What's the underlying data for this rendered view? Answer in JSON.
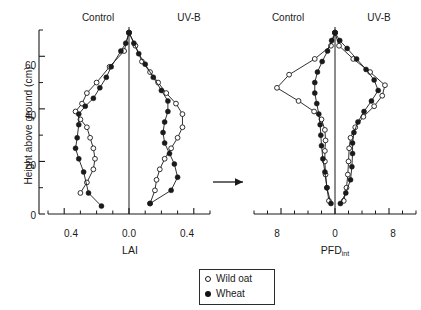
{
  "figure": {
    "ylabel": "Height above ground (cm)",
    "arrow": "arrow-right",
    "legend": {
      "items": [
        {
          "label": "Wild oat",
          "marker": "open-circle"
        },
        {
          "label": "Wheat",
          "marker": "filled-circle"
        }
      ]
    }
  },
  "chart_data": [
    {
      "type": "line",
      "id": "lai-panel",
      "title": "",
      "xlabel": "LAI",
      "ylabel": "Height above ground (cm)",
      "orientation": "horizontal-butterfly",
      "panels": [
        "Control",
        "UV-B"
      ],
      "xlim": [
        -0.5,
        0.5
      ],
      "ylim": [
        0,
        70
      ],
      "xticks_labeled": [
        {
          "value": -0.4,
          "label": "0.4"
        },
        {
          "value": 0.0,
          "label": "0.0"
        },
        {
          "value": 0.4,
          "label": "0.4"
        }
      ],
      "xticks_minor": [
        -0.5,
        -0.3,
        -0.2,
        -0.1,
        0.1,
        0.2,
        0.3,
        0.5
      ],
      "yticks_labeled": [
        {
          "value": 0,
          "label": "0"
        },
        {
          "value": 20,
          "label": "20"
        },
        {
          "value": 40,
          "label": "40"
        },
        {
          "value": 60,
          "label": "60"
        }
      ],
      "yticks_minor": [
        10,
        30,
        50,
        70
      ],
      "grid": false,
      "legend_position": "bottom-center",
      "series": [
        {
          "name": "Wild oat",
          "panel": "Control",
          "marker": "open-circle",
          "x": [
            0.0,
            -0.03,
            -0.12,
            -0.2,
            -0.26,
            -0.29,
            -0.33,
            -0.3,
            -0.26,
            -0.24,
            -0.22,
            -0.21,
            -0.22,
            -0.26,
            -0.3
          ],
          "y": [
            69,
            62,
            56,
            50,
            46,
            42,
            39,
            36,
            33,
            29,
            25,
            21,
            17,
            12,
            8
          ]
        },
        {
          "name": "Wheat",
          "panel": "Control",
          "marker": "filled-circle",
          "x": [
            0.0,
            -0.02,
            -0.05,
            -0.11,
            -0.14,
            -0.18,
            -0.22,
            -0.27,
            -0.31,
            -0.31,
            -0.32,
            -0.33,
            -0.31,
            -0.28,
            -0.25,
            -0.17
          ],
          "y": [
            69,
            65,
            62,
            56,
            52,
            48,
            44,
            41,
            38,
            34,
            29,
            25,
            21,
            16,
            8,
            3
          ]
        },
        {
          "name": "Wild oat",
          "panel": "UV-B",
          "marker": "open-circle",
          "x": [
            0.0,
            0.04,
            0.08,
            0.13,
            0.18,
            0.23,
            0.29,
            0.33,
            0.33,
            0.3,
            0.26,
            0.22,
            0.19,
            0.17,
            0.16,
            0.13
          ],
          "y": [
            69,
            64,
            58,
            54,
            50,
            46,
            42,
            38,
            33,
            29,
            25,
            21,
            17,
            13,
            9,
            4
          ]
        },
        {
          "name": "Wheat",
          "panel": "UV-B",
          "marker": "filled-circle",
          "x": [
            0.0,
            0.03,
            0.06,
            0.1,
            0.15,
            0.2,
            0.24,
            0.24,
            0.22,
            0.21,
            0.22,
            0.25,
            0.28,
            0.3,
            0.26,
            0.13
          ],
          "y": [
            69,
            65,
            61,
            57,
            52,
            47,
            43,
            39,
            35,
            31,
            27,
            23,
            19,
            14,
            9,
            4
          ]
        }
      ]
    },
    {
      "type": "line",
      "id": "pfd-panel",
      "title": "",
      "xlabel": "PFDint",
      "ylabel": "Height above ground (cm)",
      "orientation": "horizontal-butterfly",
      "panels": [
        "Control",
        "UV-B"
      ],
      "xlim": [
        -12,
        12
      ],
      "ylim": [
        0,
        70
      ],
      "xticks_labeled": [
        {
          "value": -8,
          "label": "8"
        },
        {
          "value": 0,
          "label": "0"
        },
        {
          "value": 8,
          "label": "8"
        }
      ],
      "xticks_minor": [
        -12,
        -10,
        -6,
        -4,
        -2,
        2,
        4,
        6,
        10,
        12
      ],
      "yticks_labeled": [],
      "yticks_minor": [],
      "grid": false,
      "legend_position": "bottom-center",
      "series": [
        {
          "name": "Wild oat",
          "panel": "Control",
          "marker": "open-circle",
          "x": [
            0.0,
            -0.6,
            -3.0,
            -6.8,
            -8.6,
            -5.4,
            -3.1,
            -2.0,
            -1.5,
            -1.4,
            -1.5,
            -1.5,
            -1.4,
            -1.2,
            -0.9
          ],
          "y": [
            69,
            64,
            59,
            53,
            48,
            43,
            39,
            36,
            32,
            28,
            24,
            20,
            15,
            10,
            5
          ]
        },
        {
          "name": "Wheat",
          "panel": "Control",
          "marker": "filled-circle",
          "x": [
            0.0,
            -0.5,
            -1.1,
            -1.9,
            -2.6,
            -3.0,
            -3.0,
            -2.7,
            -2.4,
            -2.2,
            -2.1,
            -2.0,
            -1.8,
            -1.5,
            -1.2,
            -0.6
          ],
          "y": [
            69,
            66,
            62,
            58,
            54,
            50,
            46,
            42,
            38,
            34,
            30,
            26,
            21,
            16,
            10,
            4
          ]
        },
        {
          "name": "Wild oat",
          "panel": "UV-B",
          "marker": "open-circle",
          "x": [
            0.0,
            0.6,
            2.7,
            5.2,
            7.4,
            7.0,
            5.8,
            4.2,
            3.0,
            2.3,
            2.1,
            2.0,
            1.9,
            1.7,
            1.3
          ],
          "y": [
            69,
            64,
            59,
            54,
            49,
            45,
            41,
            37,
            33,
            29,
            25,
            20,
            15,
            10,
            5
          ]
        },
        {
          "name": "Wheat",
          "panel": "UV-B",
          "marker": "filled-circle",
          "x": [
            0.0,
            0.7,
            1.8,
            3.2,
            4.6,
            5.8,
            6.4,
            5.4,
            4.3,
            3.4,
            2.8,
            2.6,
            2.6,
            2.5,
            2.3,
            1.6,
            0.8
          ],
          "y": [
            69,
            66,
            63,
            59,
            55,
            51,
            47,
            43,
            39,
            35,
            31,
            27,
            23,
            18,
            13,
            8,
            4
          ]
        }
      ]
    }
  ],
  "panel_titles": {
    "left_control": "Control",
    "left_uvb": "UV-B",
    "right_control": "Control",
    "right_uvb": "UV-B"
  },
  "axis_titles": {
    "lai": "LAI",
    "pfd_main": "PFD",
    "pfd_sub": "int"
  },
  "y_ticklabels": [
    "0",
    "20",
    "40",
    "60"
  ],
  "lai_ticklabels": [
    "0.4",
    "0.0",
    "0.4"
  ],
  "pfd_ticklabels": [
    "8",
    "0",
    "8"
  ]
}
